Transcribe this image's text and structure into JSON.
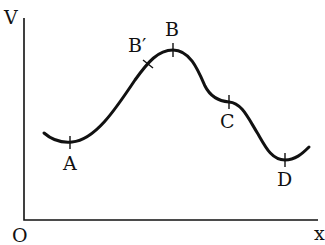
{
  "diagram": {
    "type": "potential-energy-curve",
    "axes": {
      "y_label": "V",
      "x_label": "x",
      "origin_label": "O"
    },
    "points": [
      {
        "id": "A",
        "label": "A",
        "description": "local minimum"
      },
      {
        "id": "B_prime",
        "label": "B′",
        "description": "point on rising slope before peak"
      },
      {
        "id": "B",
        "label": "B",
        "description": "maximum"
      },
      {
        "id": "C",
        "label": "C",
        "description": "inflection / shoulder"
      },
      {
        "id": "D",
        "label": "D",
        "description": "global minimum"
      }
    ],
    "colors": {
      "stroke": "#111111",
      "background": "#ffffff"
    }
  }
}
